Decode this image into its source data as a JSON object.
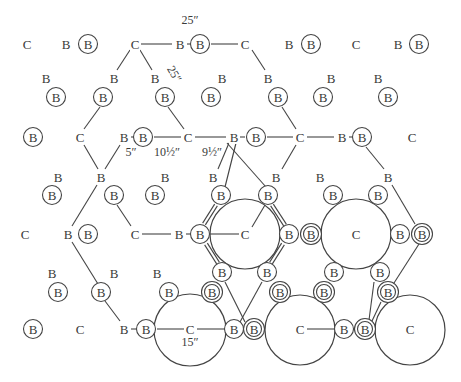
{
  "diagram": {
    "width": 461,
    "height": 382,
    "stroke_color": "#444444",
    "text_color": "#3a3a3a",
    "legend_symbols": {
      "C": "plain letter C (column / center post)",
      "B": "plain letter B",
      "circled_B": "B inside single circle",
      "double_circled_B": "B inside double circle"
    },
    "dimensions": [
      {
        "id": "dim-25-top",
        "text": "25″",
        "x": 190,
        "y": 24,
        "rotate": 0
      },
      {
        "id": "dim-25-rot",
        "text": "25″",
        "x": 171,
        "y": 76,
        "rotate": 60
      },
      {
        "id": "dim-5",
        "text": "5″",
        "x": 131,
        "y": 156,
        "rotate": 0
      },
      {
        "id": "dim-10-5",
        "text": "10½″",
        "x": 167,
        "y": 156,
        "rotate": 0
      },
      {
        "id": "dim-9-5",
        "text": "9½″",
        "x": 212,
        "y": 156,
        "rotate": 0
      },
      {
        "id": "dim-15",
        "text": "15″",
        "x": 190,
        "y": 346,
        "rotate": 0
      }
    ],
    "big_circles": [
      {
        "id": "circle-1",
        "cx": 245,
        "cy": 234,
        "r": 35
      },
      {
        "id": "circle-2",
        "cx": 356,
        "cy": 234,
        "r": 35
      },
      {
        "id": "circle-3",
        "cx": 190,
        "cy": 330,
        "r": 36
      },
      {
        "id": "circle-4",
        "cx": 300,
        "cy": 330,
        "r": 35
      },
      {
        "id": "circle-5",
        "cx": 410,
        "cy": 330,
        "r": 35
      }
    ],
    "nodes": [
      {
        "t": "C",
        "x": 27,
        "y": 44
      },
      {
        "t": "B",
        "x": 66,
        "y": 44
      },
      {
        "t": "cB",
        "x": 88,
        "y": 44
      },
      {
        "t": "C",
        "x": 135,
        "y": 44
      },
      {
        "t": "B",
        "x": 180,
        "y": 44
      },
      {
        "t": "cB",
        "x": 200,
        "y": 44
      },
      {
        "t": "C",
        "x": 245,
        "y": 44
      },
      {
        "t": "B",
        "x": 289,
        "y": 44
      },
      {
        "t": "cB",
        "x": 311,
        "y": 44
      },
      {
        "t": "C",
        "x": 356,
        "y": 44
      },
      {
        "t": "B",
        "x": 398,
        "y": 44
      },
      {
        "t": "cB",
        "x": 419,
        "y": 44
      },
      {
        "t": "B",
        "x": 46,
        "y": 78
      },
      {
        "t": "B",
        "x": 114,
        "y": 78
      },
      {
        "t": "B",
        "x": 155,
        "y": 78
      },
      {
        "t": "B",
        "x": 222,
        "y": 78
      },
      {
        "t": "B",
        "x": 268,
        "y": 78
      },
      {
        "t": "B",
        "x": 331,
        "y": 78
      },
      {
        "t": "B",
        "x": 378,
        "y": 78
      },
      {
        "t": "cB",
        "x": 56,
        "y": 97
      },
      {
        "t": "cB",
        "x": 103,
        "y": 97
      },
      {
        "t": "cB",
        "x": 165,
        "y": 97
      },
      {
        "t": "cB",
        "x": 211,
        "y": 97
      },
      {
        "t": "cB",
        "x": 278,
        "y": 97
      },
      {
        "t": "cB",
        "x": 323,
        "y": 97
      },
      {
        "t": "cB",
        "x": 388,
        "y": 97
      },
      {
        "t": "cB",
        "x": 33,
        "y": 137
      },
      {
        "t": "C",
        "x": 80,
        "y": 137
      },
      {
        "t": "B",
        "x": 124,
        "y": 137
      },
      {
        "t": "cB",
        "x": 143,
        "y": 137
      },
      {
        "t": "C",
        "x": 188,
        "y": 137
      },
      {
        "t": "B",
        "x": 234,
        "y": 137
      },
      {
        "t": "cB",
        "x": 256,
        "y": 137
      },
      {
        "t": "C",
        "x": 300,
        "y": 137
      },
      {
        "t": "B",
        "x": 342,
        "y": 137
      },
      {
        "t": "cB",
        "x": 362,
        "y": 137
      },
      {
        "t": "C",
        "x": 412,
        "y": 137
      },
      {
        "t": "B",
        "x": 58,
        "y": 177
      },
      {
        "t": "B",
        "x": 101,
        "y": 177
      },
      {
        "t": "B",
        "x": 165,
        "y": 177
      },
      {
        "t": "B",
        "x": 213,
        "y": 177
      },
      {
        "t": "B",
        "x": 276,
        "y": 177
      },
      {
        "t": "B",
        "x": 320,
        "y": 177
      },
      {
        "t": "B",
        "x": 388,
        "y": 177
      },
      {
        "t": "cB",
        "x": 52,
        "y": 195
      },
      {
        "t": "cB",
        "x": 114,
        "y": 195
      },
      {
        "t": "cB",
        "x": 155,
        "y": 195
      },
      {
        "t": "cB",
        "x": 221,
        "y": 195
      },
      {
        "t": "cB",
        "x": 268,
        "y": 195
      },
      {
        "t": "cB",
        "x": 333,
        "y": 195
      },
      {
        "t": "cB",
        "x": 378,
        "y": 195
      },
      {
        "t": "C",
        "x": 25,
        "y": 234
      },
      {
        "t": "B",
        "x": 68,
        "y": 234
      },
      {
        "t": "cB",
        "x": 88,
        "y": 234
      },
      {
        "t": "C",
        "x": 135,
        "y": 234
      },
      {
        "t": "B",
        "x": 179,
        "y": 234
      },
      {
        "t": "cB",
        "x": 200,
        "y": 234
      },
      {
        "t": "C",
        "x": 245,
        "y": 234
      },
      {
        "t": "cB",
        "x": 289,
        "y": 234
      },
      {
        "t": "ccB",
        "x": 311,
        "y": 234
      },
      {
        "t": "C",
        "x": 356,
        "y": 234
      },
      {
        "t": "cB",
        "x": 400,
        "y": 234
      },
      {
        "t": "ccB",
        "x": 422,
        "y": 234
      },
      {
        "t": "B",
        "x": 52,
        "y": 273
      },
      {
        "t": "B",
        "x": 114,
        "y": 273
      },
      {
        "t": "B",
        "x": 157,
        "y": 273
      },
      {
        "t": "cB",
        "x": 222,
        "y": 272
      },
      {
        "t": "cB",
        "x": 267,
        "y": 272
      },
      {
        "t": "cB",
        "x": 334,
        "y": 272
      },
      {
        "t": "cB",
        "x": 380,
        "y": 272
      },
      {
        "t": "cB",
        "x": 58,
        "y": 292
      },
      {
        "t": "cB",
        "x": 101,
        "y": 292
      },
      {
        "t": "cB",
        "x": 169,
        "y": 292
      },
      {
        "t": "ccB",
        "x": 212,
        "y": 292
      },
      {
        "t": "ccB",
        "x": 280,
        "y": 292
      },
      {
        "t": "ccB",
        "x": 324,
        "y": 292
      },
      {
        "t": "ccB",
        "x": 388,
        "y": 292
      },
      {
        "t": "cB",
        "x": 33,
        "y": 329
      },
      {
        "t": "C",
        "x": 80,
        "y": 329
      },
      {
        "t": "B",
        "x": 124,
        "y": 329
      },
      {
        "t": "cB",
        "x": 146,
        "y": 329
      },
      {
        "t": "C",
        "x": 190,
        "y": 329
      },
      {
        "t": "cB",
        "x": 234,
        "y": 329
      },
      {
        "t": "ccB",
        "x": 254,
        "y": 329
      },
      {
        "t": "C",
        "x": 300,
        "y": 329
      },
      {
        "t": "cB",
        "x": 344,
        "y": 329
      },
      {
        "t": "ccB",
        "x": 365,
        "y": 329
      },
      {
        "t": "C",
        "x": 410,
        "y": 329
      }
    ],
    "edges": [
      [
        141,
        44,
        172,
        44
      ],
      [
        187,
        44,
        190,
        44
      ],
      [
        211,
        44,
        238,
        44
      ],
      [
        130,
        50,
        117,
        70
      ],
      [
        140,
        50,
        152,
        70
      ],
      [
        252,
        50,
        265,
        70
      ],
      [
        100,
        107,
        84,
        129
      ],
      [
        168,
        107,
        184,
        129
      ],
      [
        282,
        107,
        296,
        129
      ],
      [
        131,
        137,
        134,
        137
      ],
      [
        154,
        137,
        181,
        137
      ],
      [
        195,
        137,
        226,
        137
      ],
      [
        240,
        137,
        245,
        137
      ],
      [
        267,
        137,
        293,
        137
      ],
      [
        307,
        137,
        334,
        137
      ],
      [
        349,
        137,
        352,
        137
      ],
      [
        84,
        145,
        98,
        169
      ],
      [
        120,
        145,
        105,
        169
      ],
      [
        229,
        143,
        218,
        169
      ],
      [
        236,
        143,
        225,
        187
      ],
      [
        227,
        143,
        266,
        187
      ],
      [
        296,
        145,
        282,
        169
      ],
      [
        366,
        147,
        384,
        169
      ],
      [
        97,
        185,
        72,
        226
      ],
      [
        117,
        205,
        131,
        226
      ],
      [
        142,
        234,
        171,
        234
      ],
      [
        186,
        234,
        190,
        234
      ],
      [
        392,
        185,
        415,
        224
      ],
      [
        207,
        234,
        239,
        234
      ],
      [
        252,
        227,
        265,
        205
      ],
      [
        72,
        242,
        98,
        284
      ],
      [
        105,
        301,
        120,
        321
      ],
      [
        131,
        329,
        136,
        329
      ],
      [
        157,
        329,
        184,
        329
      ],
      [
        197,
        329,
        226,
        329
      ],
      [
        307,
        329,
        336,
        329
      ],
      [
        419,
        244,
        394,
        283
      ],
      [
        225,
        282,
        245,
        322
      ],
      [
        262,
        282,
        240,
        322
      ],
      [
        374,
        282,
        369,
        320
      ],
      [
        381,
        302,
        372,
        321
      ]
    ],
    "double_rails": [
      {
        "from": [
          204,
          224
        ],
        "to": [
          216,
          205
        ]
      },
      {
        "from": [
          206,
          244
        ],
        "to": [
          218,
          263
        ]
      },
      {
        "from": [
          285,
          225
        ],
        "to": [
          272,
          205
        ]
      },
      {
        "from": [
          283,
          244
        ],
        "to": [
          271,
          263
        ]
      }
    ]
  }
}
